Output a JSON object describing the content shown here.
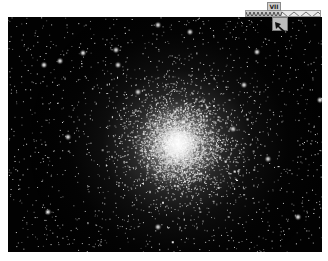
{
  "image": {
    "subject": "globular star cluster",
    "background_color": "#020202",
    "core_position_pct": [
      54,
      54
    ]
  },
  "overlay": {
    "scale_label": "VII",
    "ruler_icon": "zigzag-ruler-icon",
    "pointer_icon": "cursor-arrow-icon"
  }
}
